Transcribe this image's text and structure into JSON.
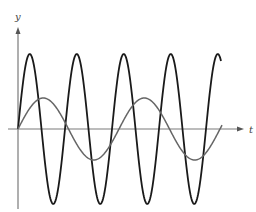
{
  "chart_data": {
    "type": "line",
    "title": "",
    "xlabel": "t",
    "ylabel": "y",
    "grid": false,
    "legend": null,
    "axes": {
      "origin_px": [
        18,
        129
      ],
      "x_axis_start_px": 8,
      "x_axis_end_px": 244,
      "y_axis_top_px": 27,
      "y_axis_bottom_px": 209,
      "color": "#7a7a7a"
    },
    "series": [
      {
        "name": "high-frequency sine",
        "color": "#1a1a1a",
        "stroke_width": 1.8,
        "amplitude_px": 75,
        "period_px": 47,
        "phase": 0,
        "t_start_px": 18,
        "t_end_px": 221,
        "peaks_x_px": [
          30,
          77,
          123,
          170,
          217
        ],
        "troughs_x_px": [
          53,
          100,
          147,
          193
        ]
      },
      {
        "name": "low-frequency sine",
        "color": "#666666",
        "stroke_width": 1.5,
        "amplitude_px": 31,
        "period_px": 101,
        "phase": 0,
        "t_start_px": 18,
        "t_end_px": 222,
        "peaks_x_px": [
          43,
          145
        ],
        "troughs_x_px": [
          95,
          195
        ]
      }
    ]
  },
  "labels": {
    "x_axis": "t",
    "y_axis": "y"
  }
}
